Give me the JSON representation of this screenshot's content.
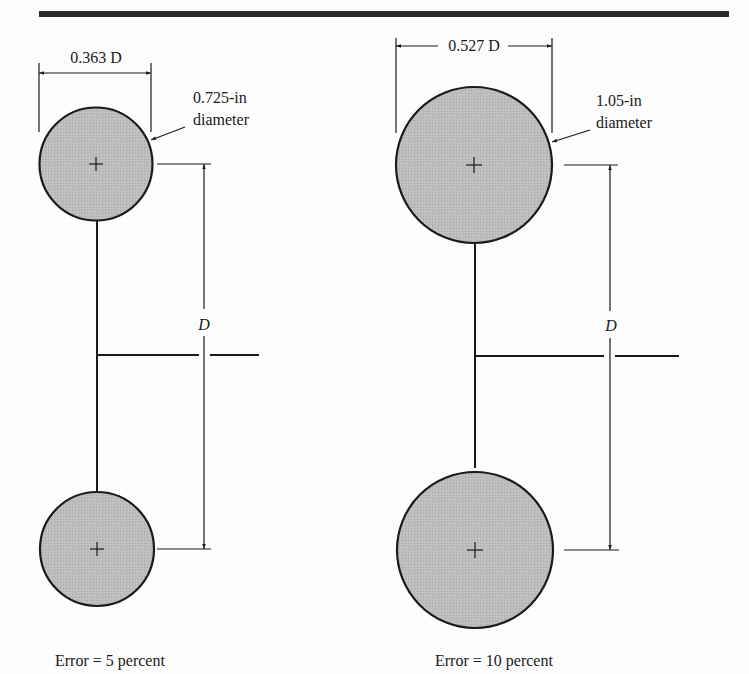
{
  "colors": {
    "ink": "#1a1a1a",
    "fill": "#b9b9b9",
    "background": "#fdfdfd",
    "top_rule": "#2a2a2a"
  },
  "figures": [
    {
      "id": "left",
      "width_dimension": "0.363 D",
      "callout_line1": "0.725-in",
      "callout_line2": "diameter",
      "spacing_dimension": "D",
      "caption": "Error = 5 percent"
    },
    {
      "id": "right",
      "width_dimension": "0.527 D",
      "callout_line1": "1.05-in",
      "callout_line2": "diameter",
      "spacing_dimension": "D",
      "caption": "Error = 10 percent"
    }
  ]
}
